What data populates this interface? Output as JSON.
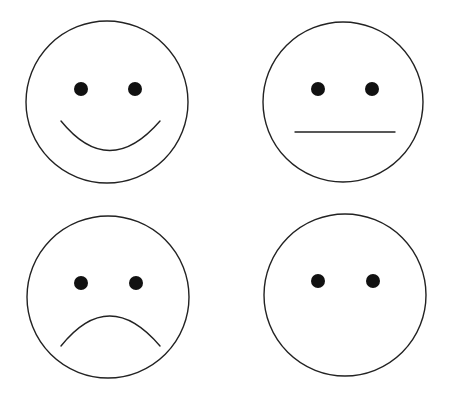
{
  "colors": {
    "background": "#ffffff",
    "stroke": "#222222",
    "eye_fill": "#111111"
  },
  "faces": [
    {
      "id": "happy",
      "label": "Happy face",
      "expression": "smile",
      "icon": "smiley-happy-icon",
      "center": [
        107,
        102
      ],
      "radius": 81,
      "eyes": [
        [
          81,
          89
        ],
        [
          135,
          89
        ]
      ],
      "mouth_path": "M61,121 Q109,180 160,121"
    },
    {
      "id": "neutral",
      "label": "Neutral face",
      "expression": "straight-line",
      "icon": "smiley-neutral-icon",
      "center": [
        343,
        102
      ],
      "radius": 80,
      "eyes": [
        [
          318,
          89
        ],
        [
          372,
          89
        ]
      ],
      "mouth_path": "M295,132 L395,132"
    },
    {
      "id": "sad",
      "label": "Sad face",
      "expression": "frown",
      "icon": "smiley-sad-icon",
      "center": [
        108,
        297
      ],
      "radius": 81,
      "eyes": [
        [
          81,
          283
        ],
        [
          136,
          283
        ]
      ],
      "mouth_path": "M61,346 Q109,286 160,346"
    },
    {
      "id": "blank",
      "label": "Face with no mouth",
      "expression": "none",
      "icon": "smiley-no-mouth-icon",
      "center": [
        345,
        295
      ],
      "radius": 81,
      "eyes": [
        [
          318,
          281
        ],
        [
          373,
          281
        ]
      ],
      "mouth_path": ""
    }
  ]
}
